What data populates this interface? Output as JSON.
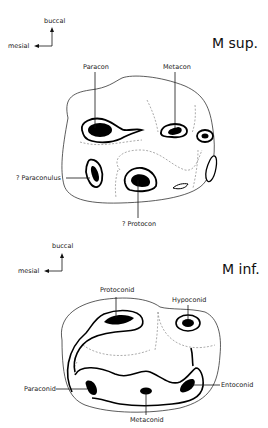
{
  "upper": {
    "title": "M sup.",
    "orientation": {
      "vertical": "buccal",
      "horizontal": "mesial"
    },
    "cusps": [
      {
        "label": "Paracon"
      },
      {
        "label": "Metacon"
      },
      {
        "label": "? Paraconulus"
      },
      {
        "label": "? Protocon"
      }
    ]
  },
  "lower": {
    "title": "M inf.",
    "orientation": {
      "vertical": "buccal",
      "horizontal": "mesial"
    },
    "cusps": [
      {
        "label": "Protoconid"
      },
      {
        "label": "Hypoconid"
      },
      {
        "label": "Paraconid"
      },
      {
        "label": "Entoconid"
      },
      {
        "label": "Metaconid"
      }
    ]
  }
}
